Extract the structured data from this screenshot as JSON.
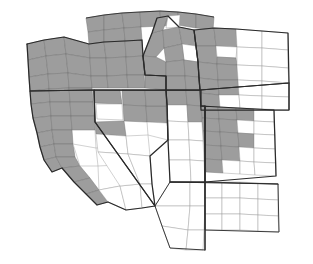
{
  "figure": {
    "kind": "choropleth-map",
    "title": "Western United States county coverage",
    "caption": "",
    "width": 313,
    "height": 264,
    "background_color": "#ffffff"
  },
  "legend": {
    "visible": false,
    "entries": [
      {
        "label": "Covered county",
        "color": "#9d9d9d"
      },
      {
        "label": "Not covered county",
        "color": "#ffffff"
      }
    ]
  },
  "style": {
    "shaded_fill": "#9d9d9d",
    "blank_fill": "#ffffff",
    "county_border": "#7a7a7a",
    "state_border": "#2a2a2a",
    "state_border_width": 1.25,
    "county_border_width": 0.45
  },
  "states": [
    {
      "code": "WA",
      "name": "Washington",
      "shaded": "partial",
      "note": "southern edge only, top-left corner"
    },
    {
      "code": "OR",
      "name": "Oregon",
      "shaded": "full",
      "note": "all counties shaded gray"
    },
    {
      "code": "ID",
      "name": "Idaho",
      "shaded": "partial",
      "note": "most counties shaded, several white gaps"
    },
    {
      "code": "MT",
      "name": "Montana",
      "shaded": "partial",
      "note": "western counties shaded, eastern white"
    },
    {
      "code": "WY",
      "name": "Wyoming",
      "shaded": "partial",
      "note": "western strip shaded"
    },
    {
      "code": "CA",
      "name": "California",
      "shaded": "partial",
      "note": "northern counties shaded, southern white"
    },
    {
      "code": "NV",
      "name": "Nevada",
      "shaded": "partial",
      "note": "northern counties shaded, southern white"
    },
    {
      "code": "UT",
      "name": "Utah",
      "shaded": "partial",
      "note": "northern counties shaded"
    },
    {
      "code": "CO",
      "name": "Colorado",
      "shaded": "partial",
      "note": "western and central counties shaded"
    },
    {
      "code": "AZ",
      "name": "Arizona",
      "shaded": "none",
      "note": "all counties white"
    },
    {
      "code": "NM",
      "name": "New Mexico",
      "shaded": "none",
      "note": "all counties white"
    }
  ],
  "counts": {
    "shaded_states": 9,
    "unshaded_states": 2,
    "total_states_drawn": 11
  }
}
